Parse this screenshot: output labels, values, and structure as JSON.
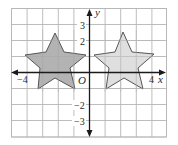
{
  "figure": {
    "type": "coordinate-grid",
    "grid": {
      "x_min": -5,
      "x_max": 5,
      "y_min": -4,
      "y_max": 4,
      "step": 1,
      "cell_px": 15.6,
      "origin_px": [
        89.5,
        72.5
      ],
      "line_color": "#b5b5b5"
    },
    "axes": {
      "x_label": "x",
      "y_label": "y",
      "origin_label": "O",
      "color": "#1a1a1a"
    },
    "tick_labels": {
      "x_neg4": "−4",
      "x_pos4": "4",
      "y_pos3": "3",
      "y_pos2": "2",
      "y_neg2": "−2",
      "y_neg3": "−3"
    },
    "stars": [
      {
        "name": "left-star",
        "fill": "#9e9e9e",
        "stroke": "#555555",
        "points": "55,33 64,52 86,55 70,68 75,89 55,78 38,89 40,68 25,55 46,52"
      },
      {
        "name": "right-star",
        "fill": "#d6d6d6",
        "stroke": "#666666",
        "points": "123,32 132,52 154,54 138,68 143,89 124,78 106,89 109,68 94,55 115,52"
      }
    ]
  }
}
